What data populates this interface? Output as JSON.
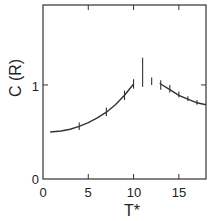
{
  "chart_data": {
    "type": "line",
    "title": "",
    "xlabel": "T*",
    "ylabel": "C (R)",
    "xlim": [
      0,
      18
    ],
    "ylim": [
      0,
      1.85
    ],
    "grid": false,
    "x_ticks": [
      0,
      5,
      10,
      15
    ],
    "x_tick_labels": [
      "0",
      "5",
      "10",
      "15"
    ],
    "y_ticks": [
      0,
      1
    ],
    "y_tick_labels": [
      "0",
      "1"
    ],
    "series": [
      {
        "name": "low-T branch",
        "x": [
          0.8,
          2,
          3,
          4,
          5,
          6,
          7,
          8,
          9,
          10
        ],
        "y": [
          0.5,
          0.51,
          0.53,
          0.56,
          0.6,
          0.65,
          0.71,
          0.79,
          0.89,
          1.01
        ]
      },
      {
        "name": "high-T branch",
        "x": [
          12.9,
          13,
          14,
          15,
          16,
          17,
          18
        ],
        "y": [
          1.02,
          1.01,
          0.95,
          0.89,
          0.85,
          0.81,
          0.79
        ]
      }
    ],
    "error_bars": [
      {
        "x": 4,
        "y": 0.56,
        "low": 0.52,
        "high": 0.6
      },
      {
        "x": 7,
        "y": 0.71,
        "low": 0.67,
        "high": 0.76
      },
      {
        "x": 9,
        "y": 0.89,
        "low": 0.84,
        "high": 0.94
      },
      {
        "x": 10,
        "y": 1.01,
        "low": 0.96,
        "high": 1.06
      },
      {
        "x": 11,
        "y": 1.13,
        "low": 0.98,
        "high": 1.29
      },
      {
        "x": 12,
        "y": 1.04,
        "low": 1.0,
        "high": 1.08
      },
      {
        "x": 13,
        "y": 1.01,
        "low": 0.95,
        "high": 1.05
      },
      {
        "x": 14,
        "y": 0.95,
        "low": 0.92,
        "high": 1.0
      },
      {
        "x": 15,
        "y": 0.89,
        "low": 0.87,
        "high": 0.93
      },
      {
        "x": 16,
        "y": 0.85,
        "low": 0.83,
        "high": 0.88
      },
      {
        "x": 17,
        "y": 0.81,
        "low": 0.79,
        "high": 0.84
      }
    ]
  }
}
